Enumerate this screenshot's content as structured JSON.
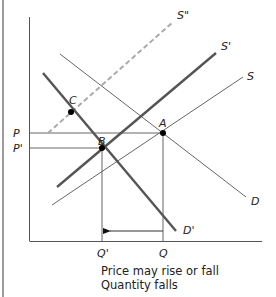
{
  "diagram": {
    "type": "supply-demand",
    "title_fragment": "...",
    "labels": {
      "s_double_prime": "S\"",
      "s_prime": "S'",
      "s": "S",
      "d": "D",
      "d_prime": "D'",
      "a": "A",
      "b": "B",
      "c": "C",
      "p": "P",
      "p_prime": "P'",
      "q": "Q",
      "q_prime": "Q'"
    },
    "caption": {
      "line1": "Price may rise or fall",
      "line2": "Quantity falls"
    },
    "colors": {
      "axis": "#555555",
      "thin_line": "#555555",
      "thick_line": "#555555",
      "dashed_line": "#aaaaaa",
      "point": "#000000"
    },
    "curves": [
      {
        "name": "S\"",
        "style": "dashed",
        "from": [
          48,
          133
        ],
        "to": [
          173,
          22
        ]
      },
      {
        "name": "S'",
        "style": "thick",
        "from": [
          57,
          187
        ],
        "to": [
          216,
          53
        ]
      },
      {
        "name": "S",
        "style": "thin",
        "from": [
          52,
          205
        ],
        "to": [
          243,
          77
        ]
      },
      {
        "name": "D",
        "style": "thin",
        "from": [
          60,
          54
        ],
        "to": [
          246,
          197
        ]
      },
      {
        "name": "D'",
        "style": "thick",
        "from": [
          43,
          73
        ],
        "to": [
          176,
          231
        ]
      }
    ],
    "points": [
      {
        "name": "A",
        "at": [
          163,
          133
        ]
      },
      {
        "name": "B",
        "at": [
          102,
          148
        ]
      },
      {
        "name": "C",
        "at": [
          71,
          112
        ]
      }
    ],
    "quantity_shift_arrow": {
      "from": "Q",
      "to": "Q'"
    }
  }
}
